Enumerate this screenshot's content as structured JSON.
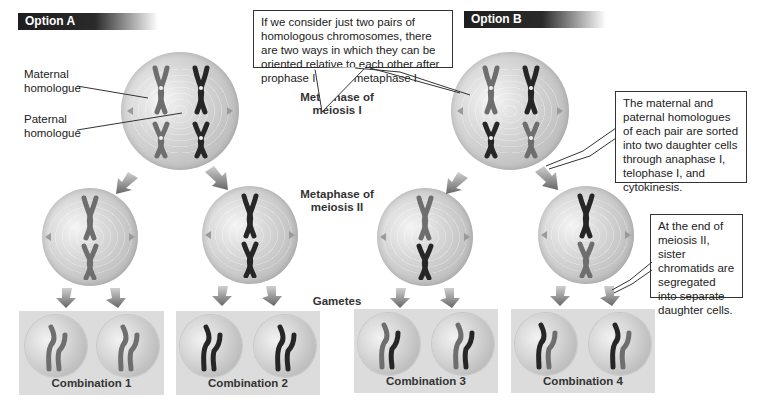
{
  "options": [
    {
      "label": "Option A"
    },
    {
      "label": "Option B"
    }
  ],
  "side_labels": {
    "maternal": "Maternal homologue",
    "paternal": "Paternal homologue"
  },
  "stage_labels": {
    "meiosis1": "Metaphase of meiosis I",
    "meiosis2": "Metaphase of meiosis II",
    "gametes": "Gametes"
  },
  "callouts": {
    "orientation": "If we consider just two pairs of homologous chromosomes, there are two ways in which they can be oriented relative to each other after prophase I during metaphase I.",
    "sorting": "The maternal and paternal homologues of each pair are sorted into two daughter cells through anaphase I, telophase I, and cytokinesis.",
    "sister": "At the end of meiosis II, sister chromatids are segregated into separate daughter cells."
  },
  "combinations": [
    {
      "label": "Combination 1"
    },
    {
      "label": "Combination 2"
    },
    {
      "label": "Combination 3"
    },
    {
      "label": "Combination 4"
    }
  ],
  "colors": {
    "maternal": "#6e6e6e",
    "paternal": "#262626",
    "cell": "#c8c8c8",
    "gamete_box": "#dcdcdc",
    "banner": "#1e1e1e"
  }
}
